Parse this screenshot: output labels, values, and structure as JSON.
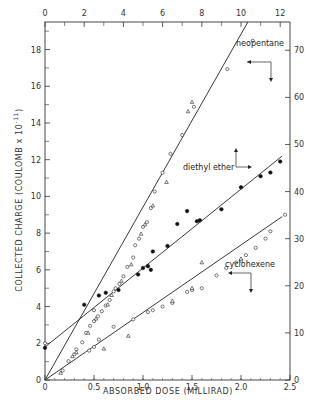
{
  "chart_data": {
    "type": "scatter",
    "title": "",
    "xlabel": "ABSORBED DOSE (MILLIRAD)",
    "ylabel": "COLLECTED CHARGE (COULOMB x 10^-11)",
    "ylabel_main": "COLLECTED CHARGE (COULOMB x 10",
    "ylabel_exp": "-11",
    "ylabel_close": ")",
    "xlim": [
      0,
      2.5
    ],
    "ylim": [
      0,
      19.5
    ],
    "x2lim": [
      0,
      12.5
    ],
    "y2lim": [
      0,
      76
    ],
    "x_ticks": [
      "0",
      "0.5",
      "1.0",
      "1.5",
      "2.0",
      "2.5"
    ],
    "x_tick_values": [
      0,
      0.5,
      1.0,
      1.5,
      2.0,
      2.5
    ],
    "y_ticks": [
      "0",
      "2",
      "4",
      "6",
      "8",
      "10",
      "12",
      "14",
      "16",
      "18"
    ],
    "y_tick_values": [
      0,
      2,
      4,
      6,
      8,
      10,
      12,
      14,
      16,
      18
    ],
    "x2_ticks": [
      "0",
      "2",
      "4",
      "6",
      "8",
      "10",
      "12"
    ],
    "x2_tick_values": [
      0,
      2,
      4,
      6,
      8,
      10,
      12
    ],
    "y2_ticks": [
      "0",
      "10",
      "20",
      "30",
      "40",
      "50",
      "60",
      "70"
    ],
    "y2_tick_values": [
      0,
      10,
      20,
      30,
      40,
      50,
      60,
      70
    ],
    "grid": false,
    "series": [
      {
        "name": "neopentane",
        "axes": "top-right",
        "fit_line": [
          [
            0,
            0
          ],
          [
            10.35,
            76
          ]
        ],
        "points_open_circle": [
          [
            0.9,
            2.0
          ],
          [
            1.2,
            4.0
          ],
          [
            1.6,
            6.5
          ],
          [
            1.9,
            8.0
          ],
          [
            2.1,
            10.0
          ],
          [
            2.3,
            11.5
          ],
          [
            2.5,
            12.5
          ],
          [
            2.7,
            13.5
          ],
          [
            2.9,
            14.6
          ],
          [
            3.1,
            15.8
          ],
          [
            3.3,
            17.0
          ],
          [
            3.5,
            18.8
          ],
          [
            3.6,
            19.5
          ],
          [
            3.8,
            20.4
          ],
          [
            4.0,
            22.0
          ],
          [
            4.2,
            24.0
          ],
          [
            4.5,
            26.0
          ],
          [
            4.6,
            28.6
          ],
          [
            4.8,
            30.0
          ],
          [
            5.0,
            32.5
          ],
          [
            5.2,
            33.5
          ],
          [
            5.4,
            36.5
          ],
          [
            5.6,
            40.0
          ],
          [
            6.0,
            44.0
          ],
          [
            6.4,
            48.0
          ],
          [
            7.0,
            52.0
          ],
          [
            7.6,
            58.0
          ],
          [
            9.3,
            66.0
          ],
          [
            10.6,
            72.0
          ]
        ],
        "points_triangle": [
          [
            0.8,
            1.5
          ],
          [
            1.4,
            5.0
          ],
          [
            2.2,
            10.0
          ],
          [
            2.6,
            13.0
          ],
          [
            3.2,
            16.0
          ],
          [
            3.4,
            18.0
          ],
          [
            3.9,
            21.0
          ],
          [
            4.4,
            24.5
          ],
          [
            4.9,
            31.0
          ],
          [
            5.1,
            33.0
          ],
          [
            5.5,
            37.0
          ],
          [
            6.2,
            42.0
          ],
          [
            7.3,
            57.0
          ],
          [
            7.5,
            59.0
          ]
        ],
        "label": "neopentane"
      },
      {
        "name": "diethyl ether",
        "axes": "bottom-left",
        "fit_line": [
          [
            0,
            1.8
          ],
          [
            2.42,
            12.2
          ]
        ],
        "points_filled": [
          [
            0.0,
            1.75
          ],
          [
            0.4,
            4.1
          ],
          [
            0.55,
            4.6
          ],
          [
            0.62,
            4.75
          ],
          [
            0.75,
            4.9
          ],
          [
            0.95,
            5.75
          ],
          [
            1.0,
            6.1
          ],
          [
            1.05,
            6.2
          ],
          [
            1.08,
            6.0
          ],
          [
            1.1,
            7.0
          ],
          [
            1.25,
            7.3
          ],
          [
            1.35,
            8.5
          ],
          [
            1.45,
            9.2
          ],
          [
            1.55,
            8.65
          ],
          [
            1.58,
            8.7
          ],
          [
            1.8,
            9.3
          ],
          [
            2.0,
            10.5
          ],
          [
            2.2,
            11.1
          ],
          [
            2.3,
            11.3
          ],
          [
            2.4,
            11.9
          ]
        ],
        "points_open": [
          [
            0.0,
            2.0
          ],
          [
            0.5,
            3.8
          ]
        ],
        "label": "diethyl ether"
      },
      {
        "name": "cyclohexene",
        "axes": "bottom-left",
        "fit_line": [
          [
            0,
            0
          ],
          [
            2.42,
            8.9
          ]
        ],
        "points_open_circle": [
          [
            0.3,
            1.4
          ],
          [
            0.45,
            1.6
          ],
          [
            0.5,
            1.8
          ],
          [
            0.55,
            2.2
          ],
          [
            0.7,
            2.9
          ],
          [
            0.9,
            3.3
          ],
          [
            1.05,
            3.7
          ],
          [
            1.1,
            3.8
          ],
          [
            1.2,
            4.0
          ],
          [
            1.3,
            4.2
          ],
          [
            1.45,
            4.8
          ],
          [
            1.5,
            4.9
          ],
          [
            1.6,
            5.0
          ],
          [
            1.75,
            5.7
          ],
          [
            1.85,
            6.1
          ],
          [
            1.95,
            6.4
          ],
          [
            2.0,
            6.5
          ],
          [
            2.05,
            6.8
          ],
          [
            2.15,
            7.2
          ],
          [
            2.25,
            7.7
          ],
          [
            2.3,
            8.1
          ],
          [
            2.45,
            9.0
          ]
        ],
        "points_triangle": [
          [
            0.32,
            1.5
          ],
          [
            0.6,
            1.7
          ],
          [
            0.85,
            2.4
          ],
          [
            1.3,
            4.3
          ],
          [
            1.5,
            5.0
          ],
          [
            1.6,
            6.4
          ],
          [
            2.0,
            6.6
          ]
        ],
        "label": "cyclohexene"
      }
    ]
  }
}
